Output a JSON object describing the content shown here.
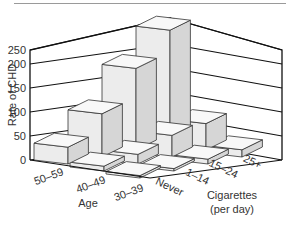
{
  "chart_data": {
    "type": "bar3d",
    "title": "",
    "ylabel": "Rate of CHD",
    "xlabel": "Cigarettes (per day)",
    "zlabel": "Age",
    "ylim": [
      0,
      250
    ],
    "yticks": [
      "0",
      "50",
      "100",
      "150",
      "200",
      "250"
    ],
    "x_categories": [
      "Never",
      "1–14",
      "15–24",
      "25+"
    ],
    "z_categories": [
      "50–59",
      "40–49",
      "30–39"
    ],
    "series": [
      {
        "name": "50–59",
        "values": [
          35,
          90,
          170,
          235
        ]
      },
      {
        "name": "40–49",
        "values": [
          10,
          20,
          45,
          55
        ]
      },
      {
        "name": "30–39",
        "values": [
          5,
          5,
          10,
          15
        ]
      }
    ],
    "grid": true
  },
  "labels": {
    "ylabel": "Rate of CHD",
    "age_title": "Age",
    "cig_title_line1": "Cigarettes",
    "cig_title_line2": "(per day)"
  }
}
